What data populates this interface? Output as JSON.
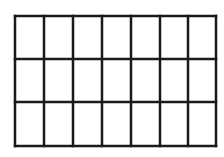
{
  "diagram": {
    "type": "grid",
    "rows": 3,
    "columns": 7,
    "cells": 21,
    "line_color": "#1a1a1a",
    "background": "#ffffff",
    "column_edges_x": [
      15,
      44,
      73,
      102,
      131,
      160,
      188,
      216
    ],
    "row_edges_y": [
      16,
      59,
      102,
      146
    ],
    "stroke_width": 2.5
  }
}
